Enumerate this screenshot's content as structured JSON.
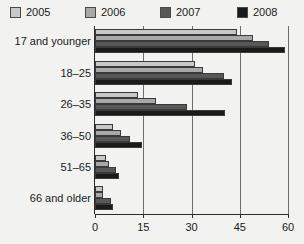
{
  "chart_data": {
    "type": "bar",
    "orientation": "horizontal",
    "title": "",
    "xlabel": "",
    "ylabel": "",
    "xlim": [
      0,
      60
    ],
    "xticks": [
      0,
      15,
      30,
      45,
      60
    ],
    "xtick_labels": [
      "0",
      "15",
      "30",
      "45",
      "60"
    ],
    "grid": true,
    "grid_axis": "x",
    "legend_position": "top",
    "categories": [
      "17 and younger",
      "18–25",
      "26–35",
      "36–50",
      "51–65",
      "66 and older"
    ],
    "series": [
      {
        "name": "2005",
        "color": "#c8c8c8",
        "values": [
          44,
          31,
          13.5,
          5.5,
          3.5,
          2.5
        ]
      },
      {
        "name": "2006",
        "color": "#a8a8a8",
        "values": [
          49,
          33.5,
          19,
          8,
          4.5,
          2.5
        ]
      },
      {
        "name": "2007",
        "color": "#585858",
        "values": [
          54,
          40,
          28.5,
          11,
          6.5,
          5
        ]
      },
      {
        "name": "2008",
        "color": "#1a1a1a",
        "values": [
          59,
          42.5,
          40.5,
          14.5,
          7.5,
          5.5
        ]
      }
    ]
  },
  "legend": {
    "entries": [
      {
        "label": "2005",
        "color": "#c8c8c8"
      },
      {
        "label": "2006",
        "color": "#a8a8a8"
      },
      {
        "label": "2007",
        "color": "#585858"
      },
      {
        "label": "2008",
        "color": "#1a1a1a"
      }
    ]
  },
  "axis": {
    "x_tick_labels": [
      "0",
      "15",
      "30",
      "45",
      "60"
    ]
  },
  "categories": [
    "17 and younger",
    "18–25",
    "26–35",
    "36–50",
    "51–65",
    "66 and older"
  ]
}
